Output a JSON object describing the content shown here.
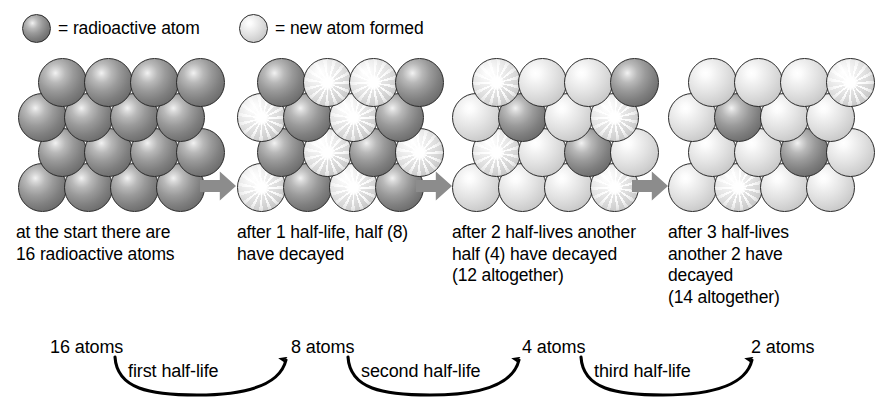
{
  "legend": {
    "items": [
      {
        "swatch": "dark-atom-swatch",
        "label": "= radioactive atom",
        "kind": "dark"
      },
      {
        "swatch": "light-atom-swatch",
        "label": "= new atom formed",
        "kind": "light"
      }
    ]
  },
  "clusters": [
    {
      "id": "cluster-start",
      "remaining_radioactive": 16,
      "rows": [
        [
          "dark",
          "dark",
          "dark",
          "dark"
        ],
        [
          "dark",
          "dark",
          "dark",
          "dark"
        ],
        [
          "dark",
          "dark",
          "dark",
          "dark"
        ],
        [
          "dark",
          "dark",
          "dark",
          "dark"
        ]
      ],
      "burst": [
        [
          false,
          false,
          false,
          false
        ],
        [
          false,
          false,
          false,
          false
        ],
        [
          false,
          false,
          false,
          false
        ],
        [
          false,
          false,
          false,
          false
        ]
      ]
    },
    {
      "id": "cluster-after-1-half-life",
      "remaining_radioactive": 8,
      "rows": [
        [
          "dark",
          "light",
          "light",
          "dark"
        ],
        [
          "light",
          "dark",
          "light",
          "dark"
        ],
        [
          "dark",
          "light",
          "dark",
          "light"
        ],
        [
          "light",
          "dark",
          "light",
          "dark"
        ]
      ],
      "burst": [
        [
          false,
          true,
          true,
          false
        ],
        [
          true,
          false,
          true,
          false
        ],
        [
          false,
          true,
          false,
          true
        ],
        [
          true,
          false,
          true,
          false
        ]
      ]
    },
    {
      "id": "cluster-after-2-half-lives",
      "remaining_radioactive": 4,
      "rows": [
        [
          "light",
          "light",
          "light",
          "dark"
        ],
        [
          "light",
          "dark",
          "light",
          "light"
        ],
        [
          "light",
          "light",
          "dark",
          "light"
        ],
        [
          "light",
          "light",
          "light",
          "light"
        ]
      ],
      "burst": [
        [
          true,
          false,
          false,
          false
        ],
        [
          false,
          false,
          false,
          true
        ],
        [
          true,
          false,
          false,
          false
        ],
        [
          false,
          false,
          false,
          true
        ]
      ]
    },
    {
      "id": "cluster-after-3-half-lives",
      "remaining_radioactive": 2,
      "rows": [
        [
          "light",
          "light",
          "light",
          "light"
        ],
        [
          "light",
          "dark",
          "light",
          "light"
        ],
        [
          "light",
          "light",
          "dark",
          "light"
        ],
        [
          "light",
          "light",
          "light",
          "light"
        ]
      ],
      "burst": [
        [
          false,
          false,
          false,
          true
        ],
        [
          false,
          false,
          false,
          false
        ],
        [
          false,
          false,
          false,
          false
        ],
        [
          false,
          true,
          false,
          false
        ]
      ]
    }
  ],
  "transition_arrows": [
    {
      "name": "arrow-stage-1-to-2"
    },
    {
      "name": "arrow-stage-2-to-3"
    },
    {
      "name": "arrow-stage-3-to-4"
    }
  ],
  "captions": [
    "at the start there are\n16 radioactive atoms",
    "after 1 half-life, half (8)\nhave decayed",
    "after 2 half-lives another\nhalf (4) have decayed\n(12 altogether)",
    "after 3 half-lives\nanother 2 have\ndecayed\n(14 altogether)"
  ],
  "summary": {
    "counts": [
      "16 atoms",
      "8 atoms",
      "4 atoms",
      "2 atoms"
    ],
    "arc_labels": [
      "first half-life",
      "second half-life",
      "third half-life"
    ]
  },
  "chart_data": {
    "type": "bar",
    "categories": [
      "start",
      "after 1 half-life",
      "after 2 half-lives",
      "after 3 half-lives"
    ],
    "series": [
      {
        "name": "radioactive atoms remaining",
        "values": [
          16,
          8,
          4,
          2
        ]
      },
      {
        "name": "new atoms formed (cumulative)",
        "values": [
          0,
          8,
          12,
          14
        ]
      }
    ],
    "xlabel": "number of half-lives elapsed",
    "ylabel": "atoms",
    "ylim": [
      0,
      16
    ],
    "grid": false,
    "legend": "top"
  }
}
